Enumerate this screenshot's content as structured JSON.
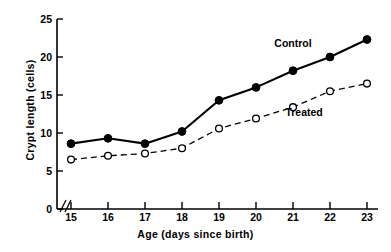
{
  "chart_data": {
    "type": "line",
    "title": "",
    "xlabel": "Age (days since birth)",
    "ylabel": "Crypt length (cells)",
    "x": [
      15,
      16,
      17,
      18,
      19,
      20,
      21,
      22,
      23
    ],
    "xtick_labels": [
      "15",
      "16",
      "17",
      "18",
      "19",
      "20",
      "21",
      "22",
      "23"
    ],
    "ytick_labels": [
      "0",
      "5",
      "10",
      "15",
      "20",
      "25"
    ],
    "ytick_values": [
      0,
      5,
      10,
      15,
      20,
      25
    ],
    "xlim": [
      15,
      23
    ],
    "ylim": [
      0,
      25
    ],
    "grid": false,
    "legend_position": "inline-annotation",
    "axis_break": "//",
    "series": [
      {
        "name": "Control",
        "marker": "filled-circle",
        "linestyle": "solid",
        "color": "#000000",
        "values": [
          8.6,
          9.3,
          8.6,
          10.2,
          14.3,
          16.0,
          18.2,
          20.0,
          22.3
        ]
      },
      {
        "name": "Treated",
        "marker": "open-circle",
        "linestyle": "dashed",
        "color": "#000000",
        "values": [
          6.5,
          7.0,
          7.3,
          8.0,
          10.6,
          11.9,
          13.4,
          15.5,
          16.5
        ]
      }
    ],
    "annotations": [
      {
        "text": "Control",
        "x": 21.0,
        "y": 21.3
      },
      {
        "text": "Treated",
        "x": 21.3,
        "y": 12.2
      }
    ]
  }
}
